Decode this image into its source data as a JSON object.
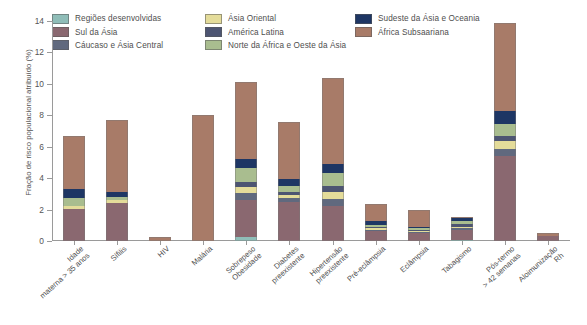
{
  "chart_data": {
    "type": "bar",
    "subtype": "stacked-bar",
    "title": "",
    "xlabel": "",
    "ylabel": "Fração de risco populacional atribuído (%)",
    "ylim": [
      0,
      14
    ],
    "yticks": [
      0,
      2,
      4,
      6,
      8,
      10,
      12,
      14
    ],
    "ytick_labels": [
      "0",
      "2",
      "4",
      "6",
      "8",
      "10",
      "12",
      "14"
    ],
    "grid": false,
    "legend_position": "top",
    "categories": [
      "Idade materna > 35 anos",
      "Sífilis",
      "HIV",
      "Malária",
      "Sobrepeso Obesidade",
      "Diabetes preexistente",
      "Hipertensão preexistente",
      "Pré-eclâmpsia",
      "Eclâmpsia",
      "Tabagismo",
      "Pós-termo > 42 semanas",
      "Aloimunização Rh"
    ],
    "category_lines": [
      [
        "Idade",
        "materna > 35 anos"
      ],
      [
        "Sífilis"
      ],
      [
        "HIV"
      ],
      [
        "Malária"
      ],
      [
        "Sobrepeso",
        "Obesidade"
      ],
      [
        "Diabetes",
        "preexistente"
      ],
      [
        "Hipertensão",
        "preexistente"
      ],
      [
        "Pré-eclâmpsia"
      ],
      [
        "Eclâmpsia"
      ],
      [
        "Tabagismo"
      ],
      [
        "Pós-termo",
        "> 42 semanas"
      ],
      [
        "Aloimunização",
        "Rh"
      ]
    ],
    "series": [
      {
        "name": "Regiões desenvolvidas",
        "color": "#8fbdb8",
        "values": [
          0,
          0,
          0,
          0,
          0.25,
          0,
          0,
          0,
          0,
          0.08,
          0,
          0
        ]
      },
      {
        "name": "Sul da Ásia",
        "color": "#8a6870",
        "values": [
          2.05,
          2.45,
          0,
          0,
          2.35,
          2.5,
          2.2,
          0.62,
          0.52,
          0.6,
          5.4,
          0.3
        ]
      },
      {
        "name": "Cáucaso e Ásia Central",
        "color": "#60697e",
        "values": [
          0,
          0,
          0,
          0,
          0.45,
          0.25,
          0.5,
          0.1,
          0.08,
          0.12,
          0.45,
          0
        ]
      },
      {
        "name": "Ásia Oriental",
        "color": "#e4dc9a",
        "values": [
          0.18,
          0.15,
          0,
          0,
          0.4,
          0.2,
          0.45,
          0.1,
          0.05,
          0.1,
          0.5,
          0
        ]
      },
      {
        "name": "América Latina",
        "color": "#4d5572",
        "values": [
          0,
          0,
          0,
          0,
          0.3,
          0.15,
          0.35,
          0.08,
          0.05,
          0.2,
          0.35,
          0
        ]
      },
      {
        "name": "Norte da África e Oeste da Ásia",
        "color": "#a9bd8f",
        "values": [
          0.5,
          0.2,
          0,
          0,
          0.9,
          0.4,
          0.85,
          0.15,
          0.1,
          0.15,
          0.75,
          0
        ]
      },
      {
        "name": "Sudeste da Ásia e Oceania",
        "color": "#1e3664",
        "values": [
          0.55,
          0.3,
          0,
          0,
          0.6,
          0.45,
          0.55,
          0.25,
          0.1,
          0.22,
          0.85,
          0
        ]
      },
      {
        "name": "África Subsaariana",
        "color": "#a87b68",
        "values": [
          3.42,
          4.6,
          0.25,
          8.05,
          4.85,
          3.65,
          5.5,
          1.05,
          1.1,
          0.08,
          5.6,
          0.22
        ]
      }
    ],
    "bar_totals": [
      6.7,
      7.7,
      0.25,
      8.05,
      10.1,
      7.6,
      10.4,
      2.35,
      2.0,
      1.55,
      13.9,
      0.52
    ]
  },
  "legend": {
    "columns": [
      [
        {
          "label": "Regiões desenvolvidas",
          "color": "#8fbdb8"
        },
        {
          "label": "Sul da Ásia",
          "color": "#8a6870"
        },
        {
          "label": "Cáucaso e Ásia Central",
          "color": "#60697e"
        }
      ],
      [
        {
          "label": "Ásia Oriental",
          "color": "#e4dc9a"
        },
        {
          "label": "América Latina",
          "color": "#4d5572"
        },
        {
          "label": "Norte da África e Oeste da Ásia",
          "color": "#a9bd8f"
        }
      ],
      [
        {
          "label": "Sudeste da Ásia e Oceania",
          "color": "#1e3664"
        },
        {
          "label": "África Subsaariana",
          "color": "#a87b68"
        }
      ]
    ]
  }
}
